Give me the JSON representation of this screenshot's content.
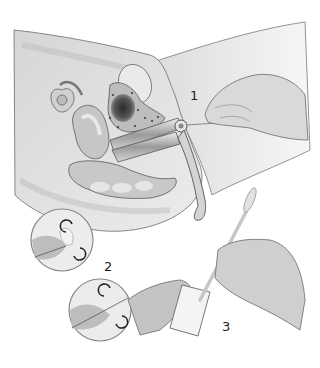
{
  "figure": {
    "type": "medical-illustration",
    "step_labels": [
      {
        "id": "1",
        "text": "1"
      },
      {
        "id": "2",
        "text": "2"
      },
      {
        "id": "3",
        "text": "3"
      }
    ],
    "colors": {
      "background": "#ffffff",
      "body": "#e2e2e2",
      "body_shadow": "#c8c8c8",
      "outline": "#6e6e6e",
      "organ": "#b8b8b8",
      "uterus_dark": "#3a3a3a",
      "instrument": "#9a9a9a"
    }
  }
}
